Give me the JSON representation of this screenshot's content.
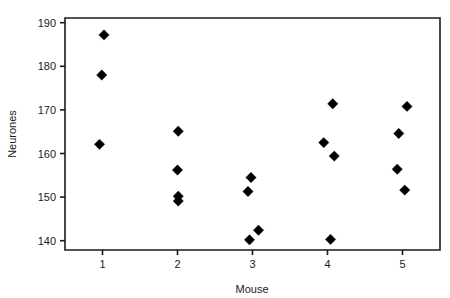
{
  "chart_data": {
    "type": "scatter",
    "title": "",
    "xlabel": "Mouse",
    "ylabel": "Neurones",
    "xlim": [
      0.5,
      5.5
    ],
    "ylim": [
      137.5,
      191.5
    ],
    "xticks": [
      1,
      2,
      3,
      4,
      5
    ],
    "xtick_labels": [
      "1",
      "2",
      "3",
      "4",
      "5"
    ],
    "yticks": [
      140,
      150,
      160,
      170,
      180,
      190
    ],
    "ytick_labels": [
      "140",
      "150",
      "160",
      "170",
      "180",
      "190"
    ],
    "grid": false,
    "legend": null,
    "marker": "diamond",
    "marker_color": "#000000",
    "series": [
      {
        "name": "Neurones per mouse",
        "points": [
          {
            "x": 1.02,
            "y": 187.2
          },
          {
            "x": 0.99,
            "y": 178.0
          },
          {
            "x": 0.96,
            "y": 162.1
          },
          {
            "x": 2.01,
            "y": 165.1
          },
          {
            "x": 2.0,
            "y": 156.2
          },
          {
            "x": 2.01,
            "y": 150.2
          },
          {
            "x": 2.01,
            "y": 149.1
          },
          {
            "x": 2.98,
            "y": 154.5
          },
          {
            "x": 2.94,
            "y": 151.3
          },
          {
            "x": 3.08,
            "y": 142.4
          },
          {
            "x": 2.96,
            "y": 140.2
          },
          {
            "x": 4.07,
            "y": 171.4
          },
          {
            "x": 3.95,
            "y": 162.5
          },
          {
            "x": 4.09,
            "y": 159.4
          },
          {
            "x": 4.04,
            "y": 140.3
          },
          {
            "x": 5.06,
            "y": 170.8
          },
          {
            "x": 4.95,
            "y": 164.6
          },
          {
            "x": 4.93,
            "y": 156.4
          },
          {
            "x": 5.03,
            "y": 151.6
          }
        ]
      }
    ]
  },
  "axes": {
    "x_title": "Mouse",
    "y_title": "Neurones"
  }
}
